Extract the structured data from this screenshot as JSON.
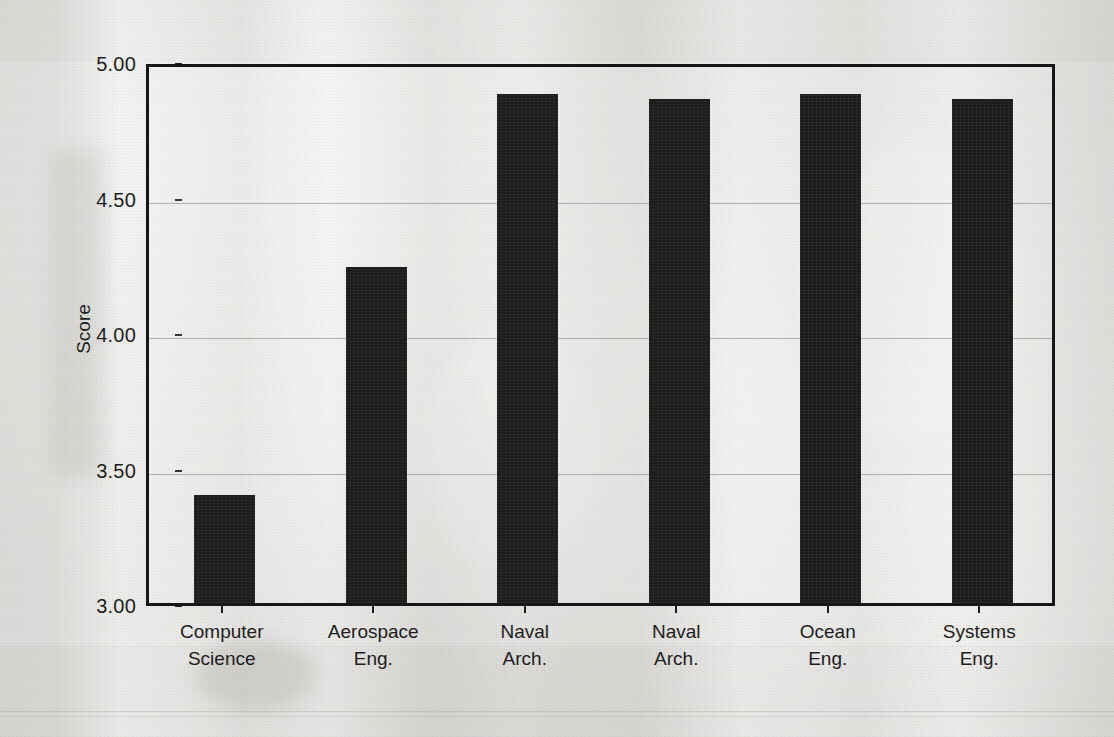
{
  "chart_data": {
    "type": "bar",
    "title": "",
    "xlabel": "",
    "ylabel": "Score",
    "ylim": [
      3.0,
      5.0
    ],
    "ytick_labels": [
      "5.00",
      "4.50",
      "4.00",
      "3.50",
      "3.00"
    ],
    "ytick_values": [
      5.0,
      4.5,
      4.0,
      3.5,
      3.0
    ],
    "grid": true,
    "legend": "none",
    "bar_color": "#1b1b1b",
    "categories": [
      "Computer Science",
      "Aerospace Eng.",
      "Naval Arch.",
      "Naval Arch.",
      "Ocean Eng.",
      "Systems Eng."
    ],
    "category_lines": [
      [
        "Computer",
        "Science"
      ],
      [
        "Aerospace",
        "Eng."
      ],
      [
        "Naval",
        "Arch."
      ],
      [
        "Naval",
        "Arch."
      ],
      [
        "Ocean",
        "Eng."
      ],
      [
        "Systems",
        "Eng."
      ]
    ],
    "values": [
      3.4,
      4.24,
      4.88,
      4.86,
      4.88,
      4.86
    ]
  },
  "figure": {
    "background_color": "#e9e8e6",
    "axis_color": "#161616",
    "gridline_color": "#69676 4",
    "text_color": "#1d1d1d"
  }
}
